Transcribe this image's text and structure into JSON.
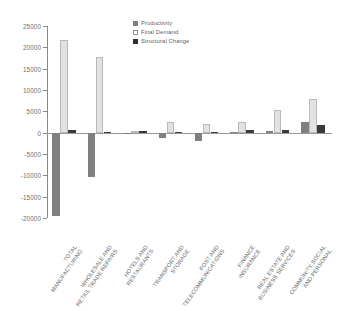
{
  "chart_data": {
    "type": "bar",
    "title": "",
    "xlabel": "",
    "ylabel": "",
    "ylim": [
      -20000,
      25000
    ],
    "ytick_step": 5000,
    "yticks": [
      25000,
      20000,
      15000,
      10000,
      5000,
      0,
      -5000,
      -10000,
      -15000,
      -20000
    ],
    "ytick_labels": [
      "25000",
      "20000",
      "15000",
      "10000",
      "5000",
      "0",
      "-5000",
      "-10000",
      "-15000",
      "-20000"
    ],
    "grid": false,
    "legend_position": "top-right",
    "categories": [
      "TOTAL MANUFACTURING",
      "WHOLESALE AND RETAIL TRADE REPAIRS",
      "HOTELS AND RESTAURANTS",
      "TRANSPORT AND STORAGE",
      "POST AND TELECOMMUNICATIONS",
      "FINANCE INSURANCE",
      "REAL ESTATE AND BUSINESS SERVICES",
      "COMMUNITY SOCIAL AND PERSONAL"
    ],
    "category_lines": [
      [
        "TOTAL",
        "MANUFACTURING"
      ],
      [
        "WHOLESALE AND",
        "RETAIL TRADE REPAIRS"
      ],
      [
        "HOTELS AND",
        "RESTAURANTS"
      ],
      [
        "TRANSPORT AND",
        "STORAGE"
      ],
      [
        "POST AND",
        "TELECOMMUNICATIONS"
      ],
      [
        "FINANCE",
        "INSURANCE"
      ],
      [
        "REAL ESTATE AND",
        "BUSINESS SERVICES"
      ],
      [
        "COMMUNITY SOCIAL",
        "AND PERSONAL"
      ]
    ],
    "series": [
      {
        "name": "Productivity",
        "color": "#808080",
        "values": [
          -19500,
          -10500,
          -200,
          -1300,
          -1900,
          200,
          400,
          2500
        ]
      },
      {
        "name": "Final Demand",
        "color": "#e2e2e2",
        "values": [
          21800,
          17700,
          300,
          2400,
          2100,
          2400,
          5400,
          8000
        ]
      },
      {
        "name": "Structural Change",
        "color": "#3a3a3a",
        "values": [
          600,
          100,
          500,
          150,
          250,
          600,
          600,
          1700
        ]
      }
    ]
  },
  "legend": {
    "items": [
      {
        "label": "Productivity",
        "swatch": "productivity-swatch"
      },
      {
        "label": "Final Demand",
        "swatch": "final-demand-swatch"
      },
      {
        "label": "Structural Change",
        "swatch": "structural-change-swatch"
      }
    ]
  }
}
